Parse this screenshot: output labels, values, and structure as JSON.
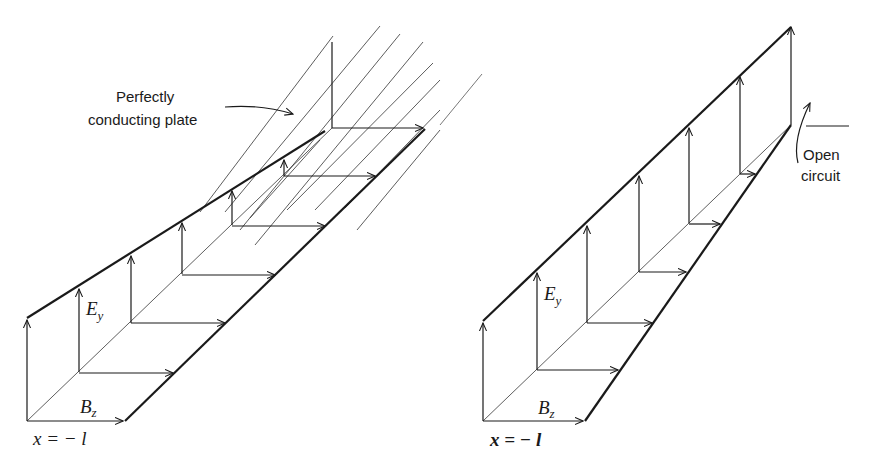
{
  "figure": {
    "left_panel": {
      "name": "short-circuited-line",
      "annotation": "Perfectly conducting plate",
      "annotation_lines": [
        "Perfectly",
        "conducting plate"
      ],
      "e_label": "E",
      "e_subscript": "y",
      "b_label": "B",
      "b_subscript": "z",
      "position_label": "x = − l"
    },
    "right_panel": {
      "name": "open-circuited-line",
      "annotation": "Open circuit",
      "annotation_lines": [
        "Open",
        "circuit"
      ],
      "e_label": "E",
      "e_subscript": "y",
      "b_label": "B",
      "b_subscript": "z",
      "position_label": "x = − l"
    },
    "colors": {
      "ink": "#1a1a1a",
      "background": "#ffffff"
    }
  }
}
